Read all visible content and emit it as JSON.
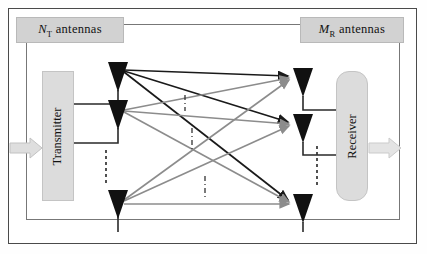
{
  "figure": {
    "labels": {
      "tx_group": {
        "symbol": "N",
        "subscript": "T",
        "text": "antennas"
      },
      "rx_group": {
        "symbol": "M",
        "subscript": "R",
        "text": "antennas"
      }
    },
    "blocks": {
      "transmitter": "Transmitter",
      "receiver": "Receiver"
    },
    "colors": {
      "frame_border": "#4a4a4a",
      "inner_border": "#777777",
      "label_fill": "#d2d2d2",
      "block_fill": "#dcdcdc",
      "antenna": "#111111",
      "path_primary": "#1a1a1a",
      "path_secondary": "#8c8c8c",
      "io_arrow": "#d9d9d9",
      "io_arrow_stroke": "#bdbdbd",
      "dashed_ellipsis": "#333333"
    },
    "tx_antennas": [
      {
        "name": "tx-antenna-1",
        "index": 1,
        "x": 118,
        "y": 66
      },
      {
        "name": "tx-antenna-2",
        "index": 2,
        "x": 118,
        "y": 104
      },
      {
        "name": "tx-antenna-3",
        "index": 3,
        "x": 118,
        "y": 196
      }
    ],
    "rx_antennas": [
      {
        "name": "rx-antenna-1",
        "index": 1,
        "x": 303,
        "y": 72
      },
      {
        "name": "rx-antenna-2",
        "index": 2,
        "x": 303,
        "y": 118
      },
      {
        "name": "rx-antenna-3",
        "index": 3,
        "x": 303,
        "y": 198
      }
    ],
    "ellipses": [
      {
        "name": "tx-ellipsis",
        "orientation": "vertical",
        "x": 106,
        "y1": 152,
        "y2": 182,
        "style": "dashed"
      },
      {
        "name": "rx-ellipsis",
        "orientation": "vertical",
        "x": 317,
        "y1": 148,
        "y2": 186,
        "style": "dashed"
      },
      {
        "name": "channel-ellipsis-1",
        "orientation": "vertical",
        "x": 185,
        "y1": 96,
        "y2": 110,
        "style": "dash-dot"
      },
      {
        "name": "channel-ellipsis-2",
        "orientation": "vertical",
        "x": 192,
        "y1": 130,
        "y2": 148,
        "style": "dash-dot"
      },
      {
        "name": "channel-ellipsis-3",
        "orientation": "vertical",
        "x": 205,
        "y1": 178,
        "y2": 198,
        "style": "dash-dot"
      }
    ],
    "channel_paths": [
      {
        "name": "path-tx1-rx1",
        "from": 1,
        "to": 1,
        "color": "primary"
      },
      {
        "name": "path-tx1-rx2",
        "from": 1,
        "to": 2,
        "color": "primary"
      },
      {
        "name": "path-tx1-rx3",
        "from": 1,
        "to": 3,
        "color": "primary"
      },
      {
        "name": "path-tx2-rx1",
        "from": 2,
        "to": 1,
        "color": "secondary"
      },
      {
        "name": "path-tx2-rx2",
        "from": 2,
        "to": 2,
        "color": "secondary"
      },
      {
        "name": "path-tx2-rx3",
        "from": 2,
        "to": 3,
        "color": "secondary"
      },
      {
        "name": "path-tx3-rx1",
        "from": 3,
        "to": 1,
        "color": "secondary"
      },
      {
        "name": "path-tx3-rx2",
        "from": 3,
        "to": 2,
        "color": "secondary"
      },
      {
        "name": "path-tx3-rx3",
        "from": 3,
        "to": 3,
        "color": "secondary"
      }
    ],
    "io": {
      "input_arrow": "input-signal-arrow",
      "output_arrow": "output-signal-arrow"
    }
  }
}
